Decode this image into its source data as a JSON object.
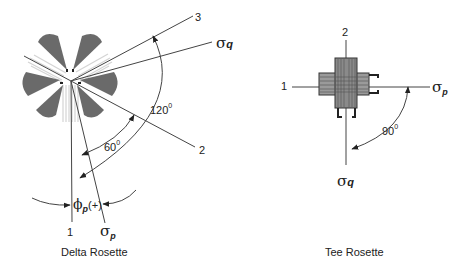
{
  "diagrams": [
    {
      "title": "Delta Rosette",
      "axes": [
        {
          "id": "1",
          "label": "1"
        },
        {
          "id": "2",
          "label": "2"
        },
        {
          "id": "3",
          "label": "3"
        }
      ],
      "stresses": {
        "sigma_p": {
          "symbol": "σ",
          "subscript": "p"
        },
        "sigma_q": {
          "symbol": "σ",
          "subscript": "q"
        }
      },
      "angles": [
        {
          "value": "60",
          "unit": "0"
        },
        {
          "value": "120",
          "unit": "0"
        }
      ],
      "phi_label": {
        "symbol": "ϕ",
        "subscript": "p",
        "suffix": "(+)"
      }
    },
    {
      "title": "Tee Rosette",
      "axes": [
        {
          "id": "1",
          "label": "1"
        },
        {
          "id": "2",
          "label": "2"
        }
      ],
      "stresses": {
        "sigma_p": {
          "symbol": "σ",
          "subscript": "p"
        },
        "sigma_q": {
          "symbol": "σ",
          "subscript": "q"
        }
      },
      "angles": [
        {
          "value": "90",
          "unit": "0"
        }
      ]
    }
  ],
  "colors": {
    "gauge": "#6a6a6a",
    "line": "#444444",
    "grid_light": "#cfcfcf"
  }
}
